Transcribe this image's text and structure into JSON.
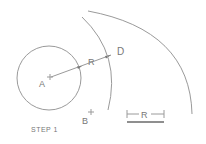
{
  "diagram": {
    "caption": "STEP 1",
    "points": {
      "A": "A",
      "B": "B",
      "D": "D"
    },
    "radius_label": "R",
    "scale_bar_label": "R",
    "colors": {
      "line": "#9a9a9a",
      "text": "#777777",
      "bar": "#6a6a6a"
    }
  }
}
